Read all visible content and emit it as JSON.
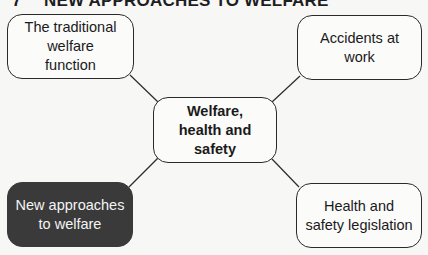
{
  "title": {
    "number": "7",
    "text": "NEW APPROACHES TO WELFARE"
  },
  "diagram": {
    "center": {
      "label": "Welfare,\nhealth and safety"
    },
    "nodes": [
      {
        "id": "top-left",
        "label": "The traditional welfare function",
        "highlighted": false
      },
      {
        "id": "top-right",
        "label": "Accidents at work",
        "highlighted": false
      },
      {
        "id": "bottom-left",
        "label": "New approaches to welfare",
        "highlighted": true
      },
      {
        "id": "bottom-right",
        "label": "Health and safety legislation",
        "highlighted": false
      }
    ]
  },
  "colors": {
    "background": "#f7f7f6",
    "border": "#2a2a2a",
    "highlight_fill": "#3a3a3a",
    "highlight_text": "#f4f4f4"
  }
}
